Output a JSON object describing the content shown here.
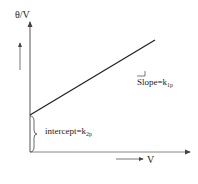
{
  "diagram": {
    "y_axis_label": "θ/V",
    "x_axis_label": "V",
    "slope_label": "Slope=k",
    "slope_subscript": "1p",
    "intercept_label": "intercept=k",
    "intercept_subscript": "2p"
  },
  "colors": {
    "axis": "#555555",
    "line": "#222222",
    "text": "#222222"
  }
}
